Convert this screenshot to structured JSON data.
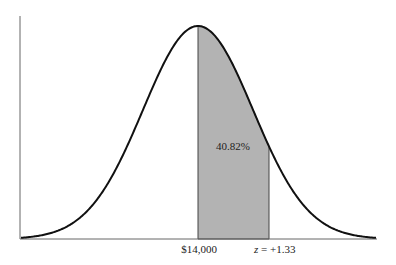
{
  "chart_data": {
    "type": "area",
    "title": "",
    "xlabel": "",
    "ylabel": "",
    "grid": false,
    "legend": null,
    "distribution": {
      "mean_label": "$14,000",
      "mean_z": 0,
      "sd_units": 1
    },
    "shaded_region": {
      "from_z": 0,
      "to_z": 1.33,
      "area_percent": 40.82,
      "label": "40.82%"
    },
    "x_tick_labels": [
      {
        "z": 0,
        "label": "$14,000"
      },
      {
        "z": 1.33,
        "label_var": "z",
        "label_rest": " = +1.33"
      }
    ],
    "colors": {
      "curve": "#111111",
      "shade": "#b3b3b3",
      "axis": "#555555"
    }
  }
}
